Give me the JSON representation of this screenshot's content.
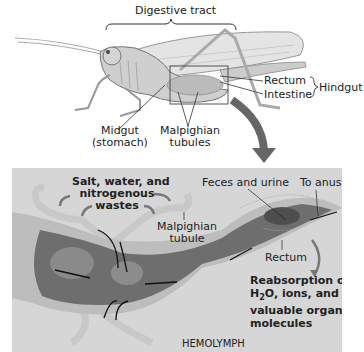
{
  "top": {
    "digestive_tract": "Digestive tract",
    "rectum": "Rectum",
    "intestine": "Intestine",
    "hindgut": "Hindgut",
    "midgut_line1": "Midgut",
    "midgut_line2": "(stomach)",
    "malpighian_line1": "Malpighian",
    "malpighian_line2": "tubules"
  },
  "detail": {
    "wastes_line1": "Salt, water, and",
    "wastes_line2": "nitrogenous",
    "wastes_line3": "wastes",
    "feces": "Feces and urine",
    "to_anus": "To anus",
    "tubule_line1": "Malpighian",
    "tubule_line2": "tubule",
    "rectum": "Rectum",
    "reabs_line1": "Reabsorption of",
    "reabs_line2_pre": "H",
    "reabs_line2_sub": "2",
    "reabs_line2_post": "O, ions, and",
    "reabs_line3": "valuable organic",
    "reabs_line4": "molecules",
    "hemolymph": "HEMOLYMPH"
  },
  "colors": {
    "panel_bg": "#d6d6d6",
    "arrow_gray": "#7a7a7a",
    "gut_dark": "#555555"
  }
}
